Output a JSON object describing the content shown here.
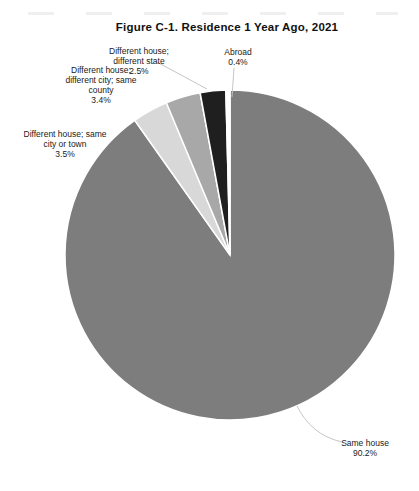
{
  "chart_data": {
    "type": "pie",
    "title": "Figure C-1. Residence 1 Year Ago, 2021",
    "unit": "percent",
    "legend": "none",
    "direction": "clockwise",
    "start_angle_deg": 0,
    "slices": [
      {
        "name": "Same house",
        "pct": 90.2,
        "color": "#7d7d7d",
        "label_lines": [
          "Same house",
          "90.2%"
        ]
      },
      {
        "name": "Different house; same city or town",
        "pct": 3.5,
        "color": "#d8d8d8",
        "label_lines": [
          "Different house; same",
          "city or town",
          "3.5%"
        ]
      },
      {
        "name": "Different house; different city; same county",
        "pct": 3.4,
        "color": "#a8a8a8",
        "label_lines": [
          "Different house;",
          "different city; same",
          "county",
          "3.4%"
        ]
      },
      {
        "name": "Different house; different state",
        "pct": 2.5,
        "color": "#1f1f1f",
        "label_lines": [
          "Different house;",
          "different state",
          "2.5%"
        ]
      },
      {
        "name": "Abroad",
        "pct": 0.4,
        "color": "#ffffff",
        "label_lines": [
          "Abroad",
          "0.4%"
        ]
      }
    ],
    "colors": {
      "background": "#ffffff",
      "text": "#1a1a1a",
      "leader_line": "#c6c6c6",
      "slice_border": "#ffffff"
    }
  }
}
